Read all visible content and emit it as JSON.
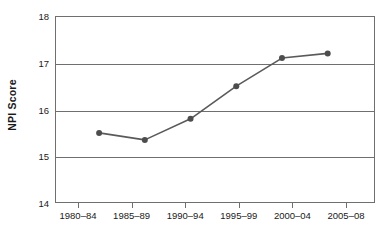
{
  "chart_data": {
    "type": "line",
    "title": "",
    "xlabel": "",
    "ylabel": "NPI Score",
    "categories": [
      "1980–84",
      "1985–89",
      "1990–94",
      "1995–99",
      "2000–04",
      "2005–08"
    ],
    "values": [
      15.5,
      15.35,
      15.8,
      16.5,
      17.1,
      17.2
    ],
    "series": [
      {
        "name": "NPI Score",
        "values": [
          15.5,
          15.35,
          15.8,
          16.5,
          17.1,
          17.2
        ]
      }
    ],
    "ylim": [
      14,
      18
    ],
    "yticks": [
      14,
      15,
      16,
      17,
      18
    ],
    "ytick_labels": [
      "14",
      "15",
      "16",
      "17",
      "18"
    ],
    "grid": "horizontal",
    "legend": "none",
    "marker": "circle",
    "colors": {
      "line": "#5a5a5a",
      "marker": "#4d4d4d",
      "grid": "#6f6f6f",
      "axis": "#6f6f6f",
      "text": "#1a1a1a",
      "background": "#ffffff"
    }
  }
}
